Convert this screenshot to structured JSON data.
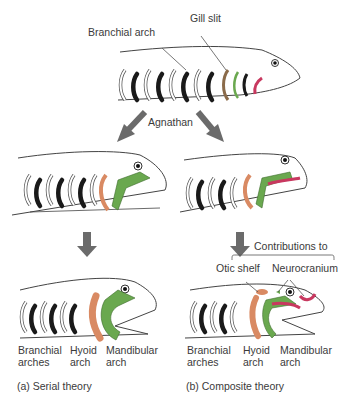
{
  "top": {
    "label_branchial_arch": "Branchial arch",
    "label_gill_slit": "Gill slit",
    "label_agnathan": "Agnathan"
  },
  "serial": {
    "label_branchial_1": "Branchial",
    "label_branchial_2": "arches",
    "label_hyoid_1": "Hyoid",
    "label_hyoid_2": "arch",
    "label_mandibular_1": "Mandibular",
    "label_mandibular_2": "arch",
    "caption": "(a) Serial theory"
  },
  "composite": {
    "label_contributions": "Contributions to",
    "label_otic_shelf": "Otic shelf",
    "label_neurocranium": "Neurocranium",
    "label_branchial_1": "Branchial",
    "label_branchial_2": "arches",
    "label_hyoid_1": "Hyoid",
    "label_hyoid_2": "arch",
    "label_mandibular_1": "Mandibular",
    "label_mandibular_2": "arch",
    "caption": "(b) Composite theory"
  },
  "colors": {
    "hyoid": "#d98a63",
    "mandibular": "#6aa84f",
    "premandibular": "#c8385f",
    "arrow": "#6b6b6b",
    "gill": "#1a1a1a"
  }
}
